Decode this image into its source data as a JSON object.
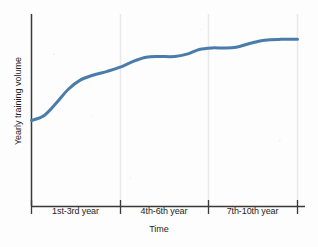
{
  "chart_data": {
    "type": "line",
    "title": "",
    "xlabel": "Time",
    "ylabel": "Yearly training volume",
    "categories": [
      "1st-3rd year",
      "4th-6th year",
      "7th-10th year"
    ],
    "series": [
      {
        "name": "Yearly training volume",
        "points": [
          {
            "x": 0.0,
            "y": 0.42
          },
          {
            "x": 0.06,
            "y": 0.45
          },
          {
            "x": 0.12,
            "y": 0.53
          },
          {
            "x": 0.18,
            "y": 0.62
          },
          {
            "x": 0.24,
            "y": 0.68
          },
          {
            "x": 0.3,
            "y": 0.71
          },
          {
            "x": 0.37,
            "y": 0.735
          },
          {
            "x": 0.43,
            "y": 0.76
          },
          {
            "x": 0.5,
            "y": 0.8
          },
          {
            "x": 0.56,
            "y": 0.825
          },
          {
            "x": 0.62,
            "y": 0.83
          },
          {
            "x": 0.7,
            "y": 0.83
          },
          {
            "x": 0.76,
            "y": 0.845
          },
          {
            "x": 0.82,
            "y": 0.875
          },
          {
            "x": 0.88,
            "y": 0.885
          },
          {
            "x": 0.94,
            "y": 0.885
          },
          {
            "x": 1.0,
            "y": 0.89
          },
          {
            "x": 1.07,
            "y": 0.915
          },
          {
            "x": 1.14,
            "y": 0.935
          },
          {
            "x": 1.22,
            "y": 0.94
          },
          {
            "x": 1.3,
            "y": 0.94
          }
        ]
      }
    ],
    "gridlines": {
      "vertical": true,
      "horizontal": false,
      "count": 3
    },
    "legend": "none",
    "xlim": [
      0,
      1.3
    ],
    "ylim": [
      0,
      1
    ],
    "yticks": [],
    "line_color": "#4a7cab",
    "line_width": 3,
    "axis_color": "#3a3a3a",
    "grid_color": "#e9e9e9",
    "background": "#fdfdfd",
    "annotation": "Stepped sigmoid growth: rapid rise in the 1st-3rd year, plateau, further rise through 4th-6th year, final plateau across 7th-10th year"
  },
  "axis": {
    "y_title": "Yearly training volume",
    "x_title": "Time",
    "x_tick_labels": [
      {
        "label": "1st-3rd year"
      },
      {
        "label": "4th-6th year"
      },
      {
        "label": "7th-10th year"
      }
    ]
  }
}
